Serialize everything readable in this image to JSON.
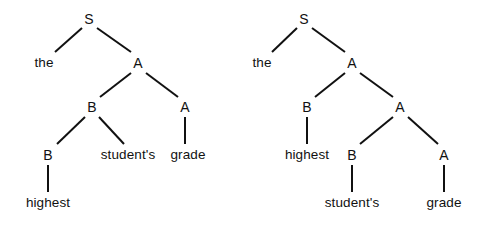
{
  "figure": {
    "background_color": "#ffffff",
    "ink_color": "#111111",
    "line_width_px": 2
  },
  "trees": [
    {
      "name": "left-parse-tree",
      "nodes": [
        {
          "id": "L-S",
          "label": "S",
          "kind": "nonterminal",
          "x": 89,
          "y": 19
        },
        {
          "id": "L-the",
          "label": "the",
          "kind": "terminal",
          "x": 44,
          "y": 63
        },
        {
          "id": "L-A1",
          "label": "A",
          "kind": "nonterminal",
          "x": 138,
          "y": 63
        },
        {
          "id": "L-B1",
          "label": "B",
          "kind": "nonterminal",
          "x": 92,
          "y": 107
        },
        {
          "id": "L-A2",
          "label": "A",
          "kind": "nonterminal",
          "x": 185,
          "y": 107
        },
        {
          "id": "L-B2",
          "label": "B",
          "kind": "nonterminal",
          "x": 48,
          "y": 155
        },
        {
          "id": "L-students",
          "label": "student's",
          "kind": "terminal",
          "x": 128,
          "y": 155
        },
        {
          "id": "L-grade",
          "label": "grade",
          "kind": "terminal",
          "x": 188,
          "y": 155
        },
        {
          "id": "L-highest",
          "label": "highest",
          "kind": "terminal",
          "x": 48,
          "y": 203
        }
      ],
      "edges": [
        {
          "from": "L-S",
          "to": "L-the",
          "x1": 82,
          "y1": 28,
          "x2": 55,
          "y2": 52
        },
        {
          "from": "L-S",
          "to": "L-A1",
          "x1": 97,
          "y1": 28,
          "x2": 131,
          "y2": 52
        },
        {
          "from": "L-A1",
          "to": "L-B1",
          "x1": 131,
          "y1": 73,
          "x2": 100,
          "y2": 97
        },
        {
          "from": "L-A1",
          "to": "L-A2",
          "x1": 146,
          "y1": 73,
          "x2": 178,
          "y2": 97
        },
        {
          "from": "L-B1",
          "to": "L-B2",
          "x1": 85,
          "y1": 117,
          "x2": 57,
          "y2": 144
        },
        {
          "from": "L-B1",
          "to": "L-students",
          "x1": 99,
          "y1": 117,
          "x2": 124,
          "y2": 144
        },
        {
          "from": "L-A2",
          "to": "L-grade",
          "x1": 185,
          "y1": 117,
          "x2": 185,
          "y2": 144
        },
        {
          "from": "L-B2",
          "to": "L-highest",
          "x1": 48,
          "y1": 165,
          "x2": 48,
          "y2": 192
        }
      ]
    },
    {
      "name": "right-parse-tree",
      "nodes": [
        {
          "id": "R-S",
          "label": "S",
          "kind": "nonterminal",
          "x": 304,
          "y": 19
        },
        {
          "id": "R-the",
          "label": "the",
          "kind": "terminal",
          "x": 262,
          "y": 63
        },
        {
          "id": "R-A1",
          "label": "A",
          "kind": "nonterminal",
          "x": 352,
          "y": 63
        },
        {
          "id": "R-B1",
          "label": "B",
          "kind": "nonterminal",
          "x": 307,
          "y": 107
        },
        {
          "id": "R-A2",
          "label": "A",
          "kind": "nonterminal",
          "x": 400,
          "y": 107
        },
        {
          "id": "R-highest",
          "label": "highest",
          "kind": "terminal",
          "x": 307,
          "y": 155
        },
        {
          "id": "R-B2",
          "label": "B",
          "kind": "nonterminal",
          "x": 352,
          "y": 155
        },
        {
          "id": "R-A3",
          "label": "A",
          "kind": "nonterminal",
          "x": 444,
          "y": 155
        },
        {
          "id": "R-students",
          "label": "student's",
          "kind": "terminal",
          "x": 352,
          "y": 203
        },
        {
          "id": "R-grade",
          "label": "grade",
          "kind": "terminal",
          "x": 444,
          "y": 203
        }
      ],
      "edges": [
        {
          "from": "R-S",
          "to": "R-the",
          "x1": 297,
          "y1": 28,
          "x2": 272,
          "y2": 52
        },
        {
          "from": "R-S",
          "to": "R-A1",
          "x1": 312,
          "y1": 28,
          "x2": 345,
          "y2": 52
        },
        {
          "from": "R-A1",
          "to": "R-B1",
          "x1": 345,
          "y1": 73,
          "x2": 315,
          "y2": 97
        },
        {
          "from": "R-A1",
          "to": "R-A2",
          "x1": 360,
          "y1": 73,
          "x2": 393,
          "y2": 97
        },
        {
          "from": "R-B1",
          "to": "R-highest",
          "x1": 307,
          "y1": 117,
          "x2": 307,
          "y2": 144
        },
        {
          "from": "R-A2",
          "to": "R-B2",
          "x1": 393,
          "y1": 117,
          "x2": 360,
          "y2": 144
        },
        {
          "from": "R-A2",
          "to": "R-A3",
          "x1": 408,
          "y1": 117,
          "x2": 438,
          "y2": 144
        },
        {
          "from": "R-B2",
          "to": "R-students",
          "x1": 352,
          "y1": 165,
          "x2": 352,
          "y2": 192
        },
        {
          "from": "R-A3",
          "to": "R-grade",
          "x1": 444,
          "y1": 165,
          "x2": 444,
          "y2": 192
        }
      ]
    }
  ]
}
